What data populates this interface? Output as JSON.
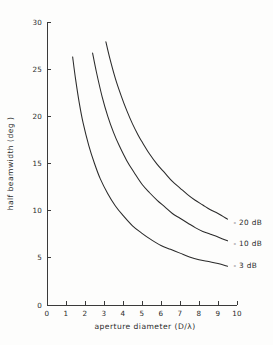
{
  "chart_data": {
    "type": "line",
    "title": "",
    "xlabel": "aperture diameter (D/λ)",
    "ylabel": "half beamwidth (deg )",
    "xlim": [
      0,
      10
    ],
    "ylim": [
      0,
      30
    ],
    "xticks": [
      "0",
      "1",
      "2",
      "3",
      "4",
      "5",
      "6",
      "7",
      "8",
      "9",
      "10"
    ],
    "xtick_values": [
      0,
      1,
      2,
      3,
      4,
      5,
      6,
      7,
      8,
      9,
      10
    ],
    "yticks": [
      "0",
      "5",
      "10",
      "15",
      "20",
      "25",
      "30"
    ],
    "ytick_values": [
      0,
      5,
      10,
      15,
      20,
      25,
      30
    ],
    "grid": false,
    "legend_position": "right-inline-end-of-curve",
    "series": [
      {
        "name": "- 20 dB",
        "label": "- 20 dB",
        "color": "#2a2a2a",
        "label_x": 9.6,
        "label_y": 8.8,
        "x": [
          3.1,
          3.3,
          3.6,
          3.9,
          4.2,
          4.5,
          4.8,
          5.0,
          5.4,
          5.8,
          6.2,
          6.6,
          7.0,
          7.4,
          7.8,
          8.2,
          8.6,
          9.0,
          9.5
        ],
        "y": [
          27.9,
          26.2,
          24.0,
          22.2,
          20.6,
          19.2,
          18.0,
          17.3,
          16.0,
          14.9,
          14.0,
          13.1,
          12.4,
          11.7,
          11.1,
          10.6,
          10.1,
          9.7,
          9.1
        ]
      },
      {
        "name": "- 10 dB",
        "label": "- 10 dB",
        "color": "#2a2a2a",
        "label_x": 9.6,
        "label_y": 6.6,
        "x": [
          2.4,
          2.6,
          2.9,
          3.2,
          3.5,
          3.8,
          4.2,
          4.6,
          5.0,
          5.4,
          5.8,
          6.2,
          6.6,
          7.0,
          7.4,
          7.8,
          8.2,
          8.6,
          9.0,
          9.5
        ],
        "y": [
          26.7,
          24.7,
          22.1,
          20.0,
          18.3,
          16.9,
          15.3,
          14.0,
          12.8,
          11.9,
          11.1,
          10.4,
          9.7,
          9.2,
          8.7,
          8.2,
          7.8,
          7.5,
          7.2,
          6.8
        ]
      },
      {
        "name": "- 3 dB",
        "label": "- 3 dB",
        "color": "#2a2a2a",
        "label_x": 9.6,
        "label_y": 4.2,
        "x": [
          1.35,
          1.5,
          1.7,
          1.9,
          2.2,
          2.5,
          2.8,
          3.2,
          3.6,
          4.0,
          4.5,
          5.0,
          5.5,
          6.0,
          6.5,
          7.0,
          7.5,
          8.0,
          8.5,
          9.0,
          9.5
        ],
        "y": [
          26.3,
          24.0,
          21.4,
          19.3,
          16.9,
          15.0,
          13.4,
          11.8,
          10.5,
          9.5,
          8.4,
          7.6,
          6.9,
          6.3,
          5.9,
          5.5,
          5.1,
          4.8,
          4.6,
          4.4,
          4.1
        ]
      }
    ]
  },
  "plot": {
    "x_axis_name": "x-axis",
    "y_axis_name": "y-axis"
  }
}
